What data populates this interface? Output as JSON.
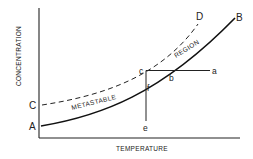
{
  "diagram": {
    "type": "solubility-supersolubility diagram",
    "axes": {
      "x_label": "TEMPERATURE",
      "y_label": "CONCENTRATION"
    },
    "curves": [
      {
        "name": "solubility-curve",
        "from": "A",
        "to": "B",
        "style": "solid"
      },
      {
        "name": "supersolubility-curve",
        "from": "C",
        "to": "D",
        "style": "dashed"
      }
    ],
    "region_labels": {
      "left": "METASTABLE",
      "right": "REGION"
    },
    "point_labels": {
      "A": "A",
      "B": "B",
      "C": "C",
      "D": "D",
      "a": "a",
      "b": "b",
      "c": "c",
      "e": "e",
      "f": "f"
    },
    "paths": [
      {
        "name": "cooling-path",
        "from": "a",
        "via": [
          "b",
          "c"
        ],
        "description": "horizontal line a-b-c"
      },
      {
        "name": "evaporation-path",
        "from": "c",
        "via": [
          "f"
        ],
        "to": "e",
        "description": "vertical line c-f-e"
      }
    ]
  }
}
